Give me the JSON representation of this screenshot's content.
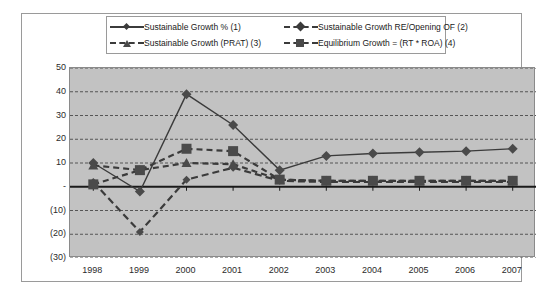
{
  "chart_data": {
    "type": "line",
    "title": "",
    "xlabel": "",
    "ylabel": "",
    "ylim": [
      -30,
      50
    ],
    "yticks": [
      "50",
      "40",
      "30",
      "20",
      "10",
      "-",
      "(10)",
      "(20)",
      "(30)"
    ],
    "ytick_values": [
      50,
      40,
      30,
      20,
      10,
      0,
      -10,
      -20,
      -30
    ],
    "grid": true,
    "legend_position": "top",
    "categories": [
      "1998",
      "1999",
      "2000",
      "2001",
      "2002",
      "2003",
      "2004",
      "2005",
      "2006",
      "2007"
    ],
    "series": [
      {
        "name": "Sustainable Growth % (1)",
        "marker": "diamond",
        "line": "solid",
        "values": [
          10,
          -2,
          39,
          26,
          7,
          13,
          14,
          14.5,
          15,
          16
        ]
      },
      {
        "name": "Sustainable Growth RE/Opening OF (2)",
        "marker": "diamond-small",
        "line": "dashed",
        "values": [
          2,
          -19,
          3,
          8,
          2.5,
          2,
          2,
          2,
          2,
          2
        ]
      },
      {
        "name": "Sustainable Growth (PRAT) (3)",
        "marker": "triangle",
        "line": "dashed",
        "values": [
          9,
          7,
          10,
          9.5,
          3,
          2.5,
          2.5,
          2.5,
          2.5,
          2.5
        ]
      },
      {
        "name": "Equilibrium Growth = (RT * ROA) (4)",
        "marker": "square",
        "line": "dashed",
        "values": [
          1,
          7,
          16,
          15,
          3,
          2.5,
          2.5,
          2.5,
          2.5,
          2.5
        ]
      }
    ],
    "colors": {
      "plot_background": "#c2c2c2",
      "frame_background": "#ffffff",
      "series_line": "#3b3b3b",
      "marker": "#4a4a4a",
      "gridline": "#555555",
      "axis": "#1a1a1a",
      "border": "#9a9a9a"
    }
  },
  "legend": {
    "items": [
      {
        "label": "Sustainable Growth % (1)"
      },
      {
        "label": "Sustainable Growth RE/Opening OF (2)"
      },
      {
        "label": "Sustainable Growth (PRAT) (3)"
      },
      {
        "label": "Equilibrium Growth = (RT * ROA) (4)"
      }
    ]
  }
}
